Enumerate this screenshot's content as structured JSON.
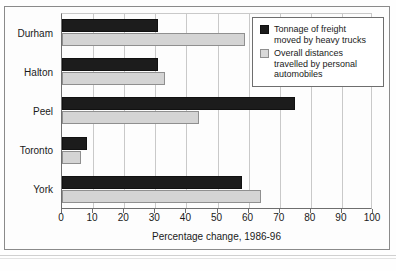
{
  "chart_data": {
    "type": "bar",
    "orientation": "horizontal",
    "title": "",
    "xlabel": "Percentage change, 1986-96",
    "ylabel": "",
    "categories": [
      "Durham",
      "Halton",
      "Peel",
      "Toronto",
      "York"
    ],
    "series": [
      {
        "name": "Tonnage of freight moved by heavy trucks",
        "color": "#1c1c1c",
        "values": [
          31,
          31,
          75,
          8,
          58
        ]
      },
      {
        "name": "Overall distances travelled by personal automobiles",
        "color": "#d4d4d4",
        "values": [
          59,
          33,
          44,
          6,
          64
        ]
      }
    ],
    "xlim": [
      0,
      100
    ],
    "xticks": [
      0,
      10,
      20,
      30,
      40,
      50,
      60,
      70,
      80,
      90,
      100
    ],
    "xtick_labels": [
      "0",
      "10",
      "20",
      "30",
      "40",
      "50",
      "60",
      "70",
      "80",
      "90",
      "100"
    ],
    "grid": true,
    "legend_position": "top-right"
  },
  "legend": {
    "entries": [
      {
        "swatch": "black",
        "line1": "Tonnage of freight",
        "line2": "moved by heavy trucks"
      },
      {
        "swatch": "grey",
        "line1": "Overall distances",
        "line2": "travelled by personal",
        "line3": "automobiles"
      }
    ]
  }
}
